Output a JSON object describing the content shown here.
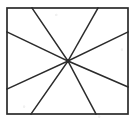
{
  "figure": {
    "background_color": "#ffffff",
    "ink_color": "#2b2b2b",
    "canvas": {
      "width": 134,
      "height": 124
    },
    "frame": {
      "label": "rectangle border",
      "left": 7,
      "top": 8,
      "right": 128,
      "bottom": 114,
      "stroke_width": 1.7
    },
    "hub": {
      "label": "convergence point",
      "x": 68,
      "y": 61
    },
    "rays": [
      {
        "name": "ray-top-left",
        "endpoint_edge": "top",
        "x": 32,
        "y": 8
      },
      {
        "name": "ray-top-right",
        "endpoint_edge": "top",
        "x": 98,
        "y": 8
      },
      {
        "name": "ray-right-upper",
        "endpoint_edge": "right",
        "x": 128,
        "y": 32
      },
      {
        "name": "ray-right-lower",
        "endpoint_edge": "right",
        "x": 128,
        "y": 87
      },
      {
        "name": "ray-bottom-right",
        "endpoint_edge": "bottom",
        "x": 96,
        "y": 114
      },
      {
        "name": "ray-bottom-left",
        "endpoint_edge": "bottom",
        "x": 31,
        "y": 114
      },
      {
        "name": "ray-left-lower",
        "endpoint_edge": "left",
        "x": 7,
        "y": 89
      },
      {
        "name": "ray-left-upper",
        "endpoint_edge": "left",
        "x": 7,
        "y": 32
      }
    ],
    "ray_count": 8,
    "chord_count": 4
  }
}
